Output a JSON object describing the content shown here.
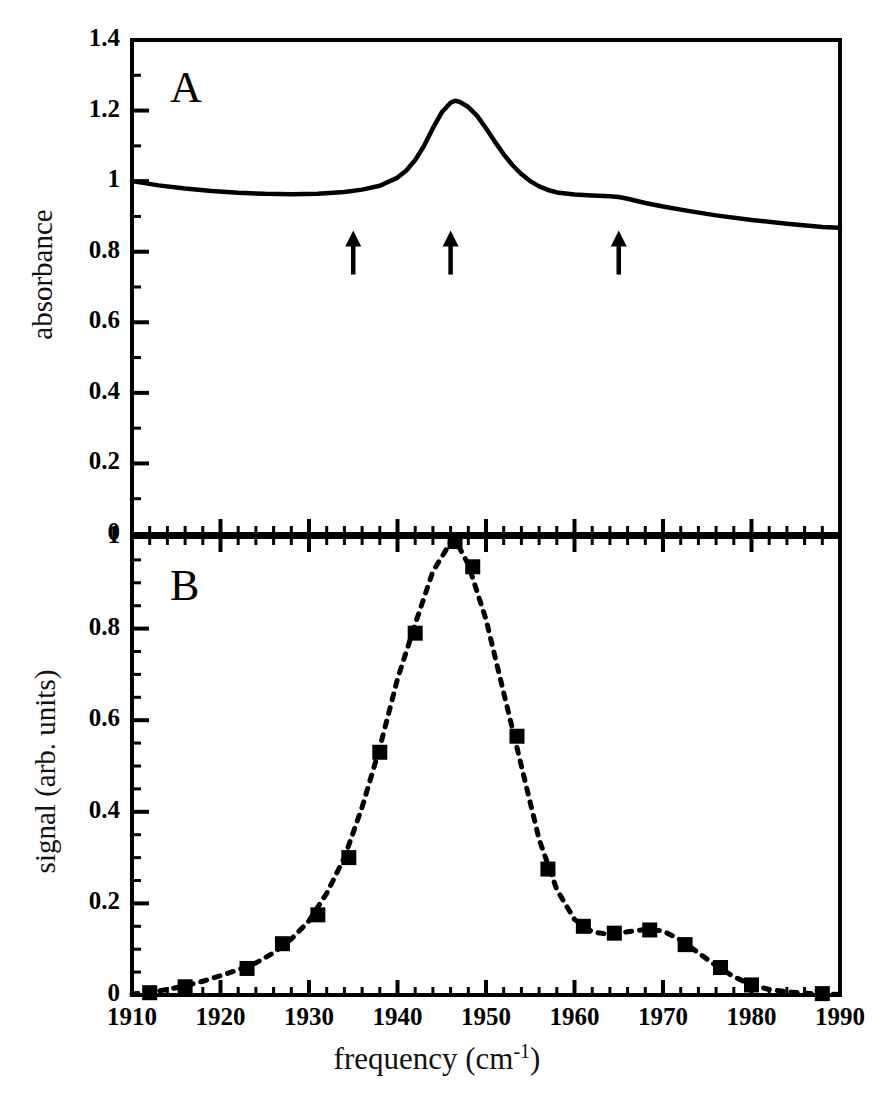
{
  "figure": {
    "xlabel_text": "frequency (cm",
    "xlabel_sup": "-1",
    "xlabel_tail": ")",
    "xlabel_full": "frequency (cm-1)",
    "panel_a_letter": "A",
    "panel_b_letter": "B",
    "line_color": "#000000",
    "background_color": "#ffffff"
  },
  "chart_data": [
    {
      "type": "line",
      "panel": "A",
      "title": "A",
      "xlabel": "frequency (cm-1)",
      "ylabel": "absorbance",
      "xlim": [
        1910,
        1990
      ],
      "ylim": [
        0,
        1.4
      ],
      "grid": false,
      "legend": "none",
      "xticks": [
        1910,
        1920,
        1930,
        1940,
        1950,
        1960,
        1970,
        1980,
        1990
      ],
      "xticklabels": [
        "1910",
        "1920",
        "1930",
        "1940",
        "1950",
        "1960",
        "1970",
        "1980",
        "1990"
      ],
      "xminor_step": 2,
      "yticks": [
        0,
        0.2,
        0.4,
        0.6,
        0.8,
        1,
        1.2,
        1.4
      ],
      "yticklabels": [
        "0",
        "0.2",
        "0.4",
        "0.6",
        "0.8",
        "1",
        "1.2",
        "1.4"
      ],
      "yminor_step": 0.1,
      "linestyle": "solid",
      "x": [
        1910,
        1913,
        1916,
        1919,
        1922,
        1925,
        1928,
        1931,
        1934,
        1936,
        1938,
        1940,
        1941,
        1942,
        1943,
        1944,
        1945,
        1946,
        1946.5,
        1947,
        1948,
        1949,
        1950,
        1951,
        1952,
        1953,
        1954,
        1955,
        1956,
        1957,
        1958,
        1960,
        1962,
        1964,
        1965,
        1966,
        1968,
        1970,
        1973,
        1976,
        1980,
        1984,
        1988,
        1990
      ],
      "y": [
        1.0,
        0.988,
        0.979,
        0.972,
        0.967,
        0.964,
        0.963,
        0.964,
        0.969,
        0.976,
        0.987,
        1.01,
        1.03,
        1.06,
        1.1,
        1.15,
        1.195,
        1.222,
        1.228,
        1.225,
        1.21,
        1.185,
        1.15,
        1.112,
        1.076,
        1.045,
        1.02,
        1.0,
        0.985,
        0.975,
        0.968,
        0.962,
        0.959,
        0.957,
        0.955,
        0.95,
        0.938,
        0.928,
        0.915,
        0.903,
        0.89,
        0.879,
        0.87,
        0.868
      ],
      "annotations": [
        {
          "type": "arrow",
          "direction": "up",
          "x": 1935,
          "y": 0.86,
          "label": "arrow-marker-1"
        },
        {
          "type": "arrow",
          "direction": "up",
          "x": 1946,
          "y": 0.86,
          "label": "arrow-marker-2"
        },
        {
          "type": "arrow",
          "direction": "up",
          "x": 1965,
          "y": 0.86,
          "label": "arrow-marker-3"
        }
      ]
    },
    {
      "type": "scatter",
      "panel": "B",
      "title": "B",
      "xlabel": "frequency (cm-1)",
      "ylabel": "signal (arb. units)",
      "xlim": [
        1910,
        1990
      ],
      "ylim": [
        0,
        1.0
      ],
      "grid": false,
      "legend": "none",
      "xticks": [
        1910,
        1920,
        1930,
        1940,
        1950,
        1960,
        1970,
        1980,
        1990
      ],
      "xticklabels": [
        "1910",
        "1920",
        "1930",
        "1940",
        "1950",
        "1960",
        "1970",
        "1980",
        "1990"
      ],
      "xminor_step": 2,
      "yticks": [
        0,
        0.2,
        0.4,
        0.6,
        0.8,
        1
      ],
      "yticklabels": [
        "0",
        "0.2",
        "0.4",
        "0.6",
        "0.8",
        "1"
      ],
      "yminor_step": 0.05,
      "marker": "filled-square",
      "fit_linestyle": "dashed",
      "points": [
        {
          "x": 1912.0,
          "y": 0.005
        },
        {
          "x": 1916.0,
          "y": 0.018
        },
        {
          "x": 1923.0,
          "y": 0.058
        },
        {
          "x": 1927.0,
          "y": 0.112
        },
        {
          "x": 1931.0,
          "y": 0.175
        },
        {
          "x": 1934.5,
          "y": 0.3
        },
        {
          "x": 1938.0,
          "y": 0.53
        },
        {
          "x": 1942.0,
          "y": 0.79
        },
        {
          "x": 1946.5,
          "y": 0.99
        },
        {
          "x": 1948.5,
          "y": 0.935
        },
        {
          "x": 1953.5,
          "y": 0.565
        },
        {
          "x": 1957.0,
          "y": 0.275
        },
        {
          "x": 1961.0,
          "y": 0.15
        },
        {
          "x": 1964.5,
          "y": 0.135
        },
        {
          "x": 1968.5,
          "y": 0.142
        },
        {
          "x": 1972.5,
          "y": 0.11
        },
        {
          "x": 1976.5,
          "y": 0.06
        },
        {
          "x": 1980.0,
          "y": 0.022
        },
        {
          "x": 1988.0,
          "y": 0.003
        }
      ],
      "fit_x": [
        1910,
        1912,
        1914,
        1916,
        1918,
        1920,
        1922,
        1924,
        1926,
        1928,
        1930,
        1932,
        1934,
        1936,
        1938,
        1940,
        1942,
        1944,
        1946,
        1946.5,
        1948,
        1950,
        1952,
        1954,
        1956,
        1958,
        1960,
        1962,
        1964,
        1966,
        1968,
        1970,
        1972,
        1974,
        1976,
        1978,
        1980,
        1982,
        1984,
        1986,
        1988,
        1990
      ],
      "fit_y": [
        0.002,
        0.006,
        0.012,
        0.02,
        0.03,
        0.042,
        0.055,
        0.07,
        0.092,
        0.122,
        0.162,
        0.222,
        0.3,
        0.41,
        0.54,
        0.69,
        0.81,
        0.925,
        0.988,
        0.995,
        0.94,
        0.82,
        0.66,
        0.5,
        0.34,
        0.23,
        0.165,
        0.138,
        0.132,
        0.138,
        0.143,
        0.14,
        0.12,
        0.092,
        0.064,
        0.04,
        0.022,
        0.012,
        0.007,
        0.004,
        0.002,
        0.001
      ]
    }
  ],
  "panel_a": {
    "ylabel": "absorbance",
    "letter": "A",
    "yticklabels": [
      "1.4",
      "1.2",
      "1",
      "0.8",
      "0.6",
      "0.4",
      "0.2",
      "0"
    ]
  },
  "panel_b": {
    "ylabel": "signal (arb. units)",
    "letter": "B",
    "yticklabels": [
      "1",
      "0.8",
      "0.6",
      "0.4",
      "0.2",
      "0"
    ]
  },
  "xaxis": {
    "label_text": "frequency (cm",
    "label_sup": "-1",
    "label_close": ")",
    "ticklabels": [
      "1910",
      "1920",
      "1930",
      "1940",
      "1950",
      "1960",
      "1970",
      "1980",
      "1990"
    ]
  }
}
